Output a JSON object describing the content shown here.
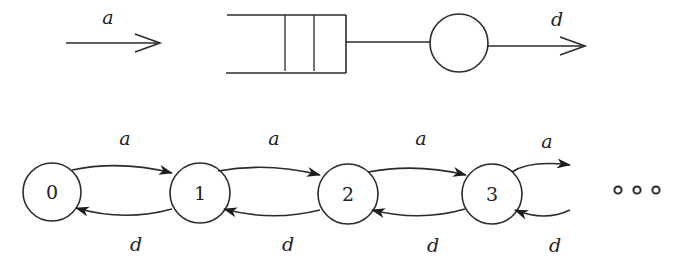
{
  "diagram": {
    "type": "queue-and-birth-death-chain",
    "queue_model": {
      "arrival_label": "a",
      "departure_label": "d",
      "buffer_slots": 2,
      "server_count": 1
    },
    "chain": {
      "states": [
        "0",
        "1",
        "2",
        "3"
      ],
      "forward_labels": [
        "a",
        "a",
        "a",
        "a"
      ],
      "backward_labels": [
        "d",
        "d",
        "d",
        "d"
      ],
      "continuation": "◦ ◦ ◦"
    },
    "colors": {
      "line": "#2b2b2b",
      "background": "#ffffff"
    }
  }
}
